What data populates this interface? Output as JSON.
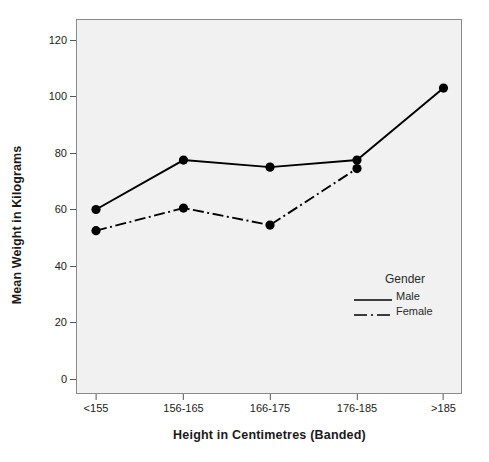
{
  "chart_data": {
    "type": "line",
    "title": "",
    "xlabel": "Height in Centimetres (Banded)",
    "ylabel": "Mean Weight in Kilograms",
    "categories": [
      "<155",
      "156-165",
      "166-175",
      "176-185",
      ">185"
    ],
    "series": [
      {
        "name": "Male",
        "line_style": "solid",
        "color": "#000000",
        "values": [
          60.0,
          77.5,
          75.0,
          77.5,
          103.0
        ]
      },
      {
        "name": "Female",
        "line_style": "dash-dot",
        "color": "#000000",
        "values": [
          52.5,
          60.5,
          54.5,
          74.5,
          null
        ]
      }
    ],
    "ylim": [
      0,
      128
    ],
    "ytick_values": [
      0,
      20,
      40,
      60,
      80,
      100,
      120
    ],
    "ytick_labels": [
      "0",
      "20",
      "40",
      "60",
      "80",
      "100",
      "120"
    ],
    "grid": false,
    "legend": {
      "title": "Gender",
      "position": "inside-lower-right",
      "entries": [
        {
          "label": "Male",
          "style": "solid"
        },
        {
          "label": "Female",
          "style": "dash-dot"
        }
      ]
    },
    "marker": "filled-circle",
    "plot_background": "#f1f1f1",
    "page_background": "#ffffff",
    "axis_color": "#8a8a8a"
  }
}
